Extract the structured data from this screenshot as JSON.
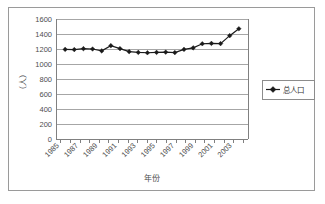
{
  "chart_data": {
    "type": "line",
    "title": "",
    "xlabel": "年份",
    "ylabel": "（人）",
    "ylim": [
      0,
      1600
    ],
    "yticks": [
      0,
      200,
      400,
      600,
      800,
      1000,
      1200,
      1400,
      1600
    ],
    "ytick_labels": [
      "0",
      "200",
      "400",
      "600",
      "800",
      "1000",
      "1200",
      "1400",
      "1600"
    ],
    "grid": true,
    "legend_position": "right",
    "x": [
      1985,
      1986,
      1987,
      1988,
      1989,
      1990,
      1991,
      1992,
      1993,
      1994,
      1995,
      1996,
      1997,
      1998,
      1999,
      2000,
      2001,
      2002,
      2003,
      2004
    ],
    "xtick_labels": [
      "1985",
      "1987",
      "1989",
      "1991",
      "1993",
      "1995",
      "1997",
      "1999",
      "2001",
      "2003"
    ],
    "xticks": [
      1985,
      1987,
      1989,
      1991,
      1993,
      1995,
      1997,
      1999,
      2001,
      2003
    ],
    "series": [
      {
        "name": "总人口",
        "marker": "diamond",
        "color": "#1a1a1a",
        "values": [
          1195,
          1192,
          1205,
          1200,
          1175,
          1245,
          1205,
          1165,
          1155,
          1150,
          1155,
          1158,
          1152,
          1195,
          1215,
          1270,
          1275,
          1272,
          1378,
          1470
        ]
      }
    ]
  },
  "legend": {
    "entries": [
      {
        "label": "总人口"
      }
    ]
  },
  "icons": {
    "diamond_marker": "diamond-marker-icon"
  }
}
